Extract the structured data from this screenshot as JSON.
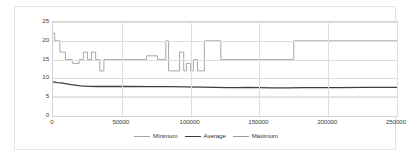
{
  "chart_data": {
    "type": "line",
    "title": "",
    "xlabel": "",
    "ylabel": "",
    "xlim": [
      0,
      250000
    ],
    "ylim": [
      0,
      25
    ],
    "grid": true,
    "legend_position": "bottom",
    "yticks": [
      "0",
      "5",
      "10",
      "15",
      "20",
      "25"
    ],
    "ytick_values": [
      0,
      5,
      10,
      15,
      20,
      25
    ],
    "xticks": [
      "0",
      "50000",
      "100000",
      "150000",
      "200000",
      "250000"
    ],
    "xtick_values": [
      0,
      50000,
      100000,
      150000,
      200000,
      250000
    ],
    "series": [
      {
        "name": "Minimum",
        "color": "#a6a6a6",
        "x": [
          0,
          250000
        ],
        "values": [
          5,
          5
        ]
      },
      {
        "name": "Average",
        "color": "#3f3f3f",
        "x": [
          0,
          3000,
          6000,
          9000,
          12000,
          16000,
          20000,
          26000,
          34000,
          44000,
          56000,
          70000,
          84000,
          96000,
          108000,
          118000,
          126000,
          134000,
          142000,
          150000,
          160000,
          170000,
          182000,
          195000,
          210000,
          225000,
          240000,
          250000
        ],
        "values": [
          9.1,
          8.9,
          8.8,
          8.6,
          8.4,
          8.2,
          8.0,
          7.9,
          7.85,
          7.9,
          7.85,
          7.8,
          7.8,
          7.75,
          7.7,
          7.6,
          7.55,
          7.55,
          7.6,
          7.55,
          7.5,
          7.5,
          7.55,
          7.55,
          7.55,
          7.6,
          7.6,
          7.6
        ]
      },
      {
        "name": "Maximum",
        "color": "#9d9d9d",
        "x": [
          0,
          1200,
          1200,
          5000,
          5000,
          9000,
          9000,
          14000,
          14000,
          19000,
          19000,
          22000,
          22000,
          25000,
          25000,
          28000,
          28000,
          31000,
          31000,
          34000,
          34000,
          37000,
          37000,
          41000,
          41000,
          68000,
          68000,
          76000,
          76000,
          82000,
          82000,
          84000,
          84000,
          86000,
          86000,
          92000,
          92000,
          95000,
          95000,
          97000,
          97000,
          100000,
          100000,
          102000,
          102000,
          105000,
          105000,
          110000,
          110000,
          122000,
          122000,
          130000,
          130000,
          175000,
          175000,
          250000
        ],
        "values": [
          22,
          22,
          20,
          20,
          17,
          17,
          15,
          15,
          14,
          14,
          15,
          15,
          17,
          17,
          15,
          15,
          17,
          17,
          15,
          15,
          12,
          12,
          15,
          15,
          15,
          15,
          16,
          16,
          15,
          15,
          20,
          20,
          12,
          12,
          12,
          12,
          17,
          17,
          12,
          12,
          14,
          14,
          12,
          12,
          15,
          15,
          12,
          12,
          20,
          20,
          15,
          15,
          15,
          15,
          20,
          20
        ]
      }
    ]
  },
  "legend": {
    "items": [
      {
        "label": "Minimum",
        "color": "#a6a6a6"
      },
      {
        "label": "Average",
        "color": "#3f3f3f"
      },
      {
        "label": "Maximum",
        "color": "#9d9d9d"
      }
    ]
  }
}
